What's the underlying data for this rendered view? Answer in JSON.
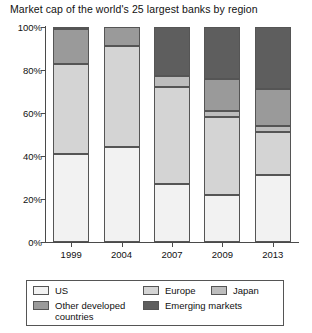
{
  "chart_data": {
    "type": "bar",
    "subtype": "stacked-percentage-column",
    "title": "Market cap of the world's 25 largest banks by region",
    "xlabel": "",
    "ylabel": "",
    "ylim": [
      0,
      100
    ],
    "ytick_labels": [
      "0%",
      "20%",
      "40%",
      "60%",
      "80%",
      "100%"
    ],
    "ytick_values": [
      0,
      20,
      40,
      60,
      80,
      100
    ],
    "grid": false,
    "legend_position": "bottom",
    "categories": [
      "1999",
      "2004",
      "2007",
      "2009",
      "2013"
    ],
    "series": [
      {
        "name": "US",
        "color": "#f2f2f2",
        "values": [
          41,
          44,
          27,
          22,
          31
        ]
      },
      {
        "name": "Europe",
        "color": "#d4d4d4",
        "values": [
          42,
          47,
          45,
          36,
          20
        ]
      },
      {
        "name": "Japan",
        "color": "#bdbdbd",
        "values": [
          0,
          0,
          5,
          3,
          3
        ]
      },
      {
        "name": "Other developed countries",
        "color": "#9a9a9a",
        "values": [
          16,
          9,
          0,
          15,
          17
        ]
      },
      {
        "name": "Emerging markets",
        "color": "#5e5e5e",
        "values": [
          1,
          0,
          23,
          24,
          29
        ]
      }
    ]
  },
  "legend": {
    "entries": [
      {
        "label": "US"
      },
      {
        "label": "Europe"
      },
      {
        "label": "Japan"
      },
      {
        "label": "Other developed\ncountries"
      },
      {
        "label": "Emerging markets"
      }
    ]
  },
  "colors": {
    "axis": "#4a4a4a",
    "segment_border": "#555555",
    "text": "#111111",
    "background": "#ffffff"
  }
}
